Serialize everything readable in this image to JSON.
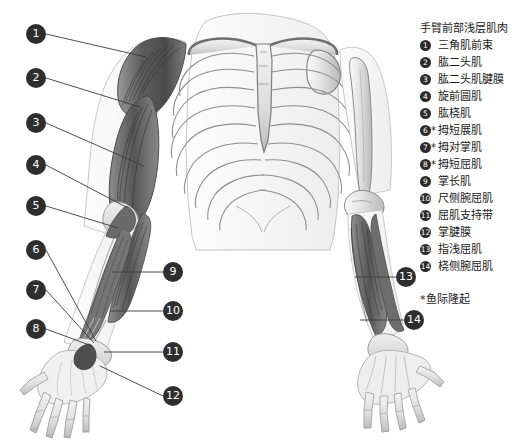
{
  "figure": {
    "background_color": "#ffffff",
    "ink_color": "#2e2e2e",
    "muscle_dark": "#6e6e6e",
    "bone_light": "#d8d8d8",
    "leader_line_color": "#3a3a3a"
  },
  "legend": {
    "title": "手臂前部浅层肌肉",
    "items": [
      {
        "number": "1",
        "marker": "❶",
        "star": "",
        "label": "三角肌前束"
      },
      {
        "number": "2",
        "marker": "❷",
        "star": "",
        "label": "肱二头肌"
      },
      {
        "number": "3",
        "marker": "❸",
        "star": "",
        "label": "肱二头肌腱膜"
      },
      {
        "number": "4",
        "marker": "❹",
        "star": "",
        "label": "旋前圆肌"
      },
      {
        "number": "5",
        "marker": "❺",
        "star": "",
        "label": "肱桡肌"
      },
      {
        "number": "6",
        "marker": "❻",
        "star": "*",
        "label": "拇短展肌"
      },
      {
        "number": "7",
        "marker": "❼",
        "star": "*",
        "label": "拇对掌肌"
      },
      {
        "number": "8",
        "marker": "❽",
        "star": "*",
        "label": "拇短屈肌"
      },
      {
        "number": "9",
        "marker": "❾",
        "star": "",
        "label": "掌长肌"
      },
      {
        "number": "10",
        "marker": "❿",
        "star": "",
        "label": "尺侧腕屈肌"
      },
      {
        "number": "11",
        "marker": "➀",
        "star": "",
        "label": "屈肌支持带"
      },
      {
        "number": "12",
        "marker": "➁",
        "star": "",
        "label": "掌腱膜"
      },
      {
        "number": "13",
        "marker": "➂",
        "star": "",
        "label": "指浅屈肌"
      },
      {
        "number": "14",
        "marker": "➃",
        "star": "",
        "label": "桡侧腕屈肌"
      }
    ],
    "footnote": "*鱼际隆起"
  },
  "callouts": [
    {
      "id": "1",
      "label": "1",
      "x": 26,
      "y": 24,
      "line": [
        46,
        34,
        146,
        57
      ]
    },
    {
      "id": "2",
      "label": "2",
      "x": 26,
      "y": 68,
      "line": [
        46,
        78,
        140,
        107
      ]
    },
    {
      "id": "3",
      "label": "3",
      "x": 26,
      "y": 113,
      "line": [
        46,
        123,
        144,
        166
      ]
    },
    {
      "id": "4",
      "label": "4",
      "x": 26,
      "y": 155,
      "line": [
        46,
        165,
        126,
        207
      ]
    },
    {
      "id": "5",
      "label": "5",
      "x": 26,
      "y": 196,
      "line": [
        46,
        206,
        118,
        228
      ]
    },
    {
      "id": "6",
      "label": "6",
      "x": 26,
      "y": 240,
      "line": [
        46,
        250,
        96,
        341
      ]
    },
    {
      "id": "7",
      "label": "7",
      "x": 26,
      "y": 280,
      "line": [
        46,
        290,
        94,
        343
      ]
    },
    {
      "id": "8",
      "label": "8",
      "x": 26,
      "y": 319,
      "line": [
        46,
        329,
        92,
        346
      ]
    },
    {
      "id": "9",
      "label": "9",
      "x": 163,
      "y": 262,
      "line": [
        163,
        272,
        112,
        272
      ]
    },
    {
      "id": "10",
      "label": "10",
      "x": 163,
      "y": 301,
      "line": [
        163,
        311,
        110,
        311
      ]
    },
    {
      "id": "11",
      "label": "11",
      "x": 163,
      "y": 342,
      "line": [
        163,
        352,
        104,
        352
      ]
    },
    {
      "id": "12",
      "label": "12",
      "x": 163,
      "y": 386,
      "line": [
        163,
        396,
        100,
        366
      ]
    },
    {
      "id": "13",
      "label": "13",
      "x": 396,
      "y": 267,
      "line": [
        396,
        277,
        355,
        277
      ]
    },
    {
      "id": "14",
      "label": "14",
      "x": 404,
      "y": 310,
      "line": [
        404,
        320,
        360,
        320
      ]
    }
  ]
}
